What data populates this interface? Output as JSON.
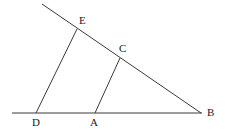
{
  "figure": {
    "type": "geometry-diagram",
    "background_color": "#ffffff",
    "line_color": "#3a3a3a",
    "label_color": "#1c1c1c",
    "canvas": {
      "width": 225,
      "height": 134
    },
    "points": [
      {
        "id": "E",
        "label": "E",
        "x": 77,
        "y": 29,
        "label_x": 79,
        "label_y": 15
      },
      {
        "id": "C",
        "label": "C",
        "x": 120,
        "y": 58,
        "label_x": 119,
        "label_y": 43
      },
      {
        "id": "D",
        "label": "D",
        "x": 36,
        "y": 113,
        "label_x": 32,
        "label_y": 117
      },
      {
        "id": "A",
        "label": "A",
        "x": 95,
        "y": 113,
        "label_x": 90,
        "label_y": 117
      },
      {
        "id": "B",
        "label": "B",
        "x": 201,
        "y": 113,
        "label_x": 207,
        "label_y": 107
      }
    ],
    "segments": [
      {
        "id": "baseline",
        "name": "horizontal-baseline",
        "x1": 12,
        "y1": 113,
        "x2": 202,
        "y2": 113
      },
      {
        "id": "ray-top",
        "name": "diagonal-ray-through-E-C-to-B",
        "x1": 42,
        "y1": 4,
        "x2": 201,
        "y2": 113
      },
      {
        "id": "seg-DE",
        "name": "segment-D-to-E",
        "x1": 36,
        "y1": 113,
        "x2": 77,
        "y2": 29
      },
      {
        "id": "seg-AC",
        "name": "segment-A-to-C",
        "x1": 95,
        "y1": 113,
        "x2": 120,
        "y2": 58
      }
    ]
  }
}
